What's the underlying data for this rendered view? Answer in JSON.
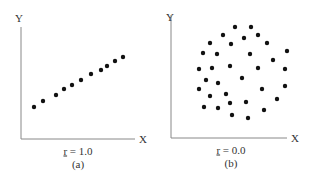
{
  "chart_data": [
    {
      "type": "scatter",
      "panel": "(a)",
      "caption": "r = 1.0",
      "xlabel": "X",
      "ylabel": "Y",
      "grid": false,
      "points_px": [
        [
          34,
          107
        ],
        [
          43,
          101
        ],
        [
          56,
          95
        ],
        [
          64,
          89
        ],
        [
          72,
          85
        ],
        [
          81,
          80
        ],
        [
          91,
          74
        ],
        [
          101,
          70
        ],
        [
          107,
          66
        ],
        [
          115,
          61
        ],
        [
          123,
          57
        ]
      ],
      "axes": {
        "origin": [
          21,
          139
        ],
        "x_end": 135,
        "y_top": 27
      }
    },
    {
      "type": "scatter",
      "panel": "(b)",
      "caption": "r = 0.0",
      "xlabel": "X",
      "ylabel": "Y",
      "grid": false,
      "points_px": [
        [
          235,
          27
        ],
        [
          251,
          27
        ],
        [
          223,
          35
        ],
        [
          244,
          38
        ],
        [
          258,
          35
        ],
        [
          210,
          43
        ],
        [
          231,
          44
        ],
        [
          267,
          43
        ],
        [
          203,
          53
        ],
        [
          217,
          54
        ],
        [
          250,
          54
        ],
        [
          287,
          51
        ],
        [
          273,
          60
        ],
        [
          199,
          69
        ],
        [
          212,
          68
        ],
        [
          230,
          66
        ],
        [
          258,
          68
        ],
        [
          285,
          69
        ],
        [
          206,
          80
        ],
        [
          218,
          83
        ],
        [
          242,
          78
        ],
        [
          199,
          89
        ],
        [
          262,
          89
        ],
        [
          285,
          86
        ],
        [
          210,
          96
        ],
        [
          226,
          94
        ],
        [
          277,
          99
        ],
        [
          204,
          107
        ],
        [
          218,
          108
        ],
        [
          230,
          103
        ],
        [
          246,
          102
        ],
        [
          264,
          110
        ],
        [
          232,
          115
        ],
        [
          248,
          118
        ]
      ],
      "axes": {
        "origin": [
          171,
          138
        ],
        "x_end": 287,
        "y_top": 15
      }
    }
  ],
  "labels": {
    "a": {
      "y": "Y",
      "x": "X",
      "r_symbol": "r",
      "r_rest": " = 1.0",
      "panel": "(a)"
    },
    "b": {
      "y": "Y",
      "x": "X",
      "r_symbol": "r",
      "r_rest": " = 0.0",
      "panel": "(b)"
    }
  },
  "colors": {
    "dot": "#111111",
    "axis": "#888888"
  }
}
